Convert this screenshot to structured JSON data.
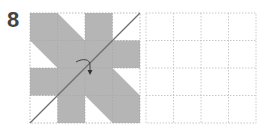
{
  "step": {
    "number": "8"
  },
  "colors": {
    "number_text": "#444444",
    "shape_fill": "#b5b5b5",
    "grid_line": "#bbbbbb",
    "fold_line": "#6e6e6e",
    "arrow": "#333333",
    "background": "#ffffff"
  },
  "diagram": {
    "grid_rows": 4,
    "grid_cols": 4,
    "left_grid": {
      "description": "folding diagram with shaded pinwheel shape, diagonal fold line and curved fold arrow",
      "origin_px": [
        30,
        13
      ],
      "size_px": 110,
      "shape_polygon_grid_units": [
        [
          0,
          0
        ],
        [
          1,
          0
        ],
        [
          2,
          1
        ],
        [
          2,
          0
        ],
        [
          3,
          0
        ],
        [
          3,
          1
        ],
        [
          4,
          1
        ],
        [
          4,
          2
        ],
        [
          3,
          2
        ],
        [
          4,
          3
        ],
        [
          4,
          4
        ],
        [
          3,
          4
        ],
        [
          2,
          3
        ],
        [
          2,
          4
        ],
        [
          1,
          4
        ],
        [
          1,
          3
        ],
        [
          0,
          3
        ],
        [
          0,
          2
        ],
        [
          1,
          2
        ],
        [
          0,
          1
        ]
      ],
      "fold_line": {
        "from_grid": [
          0,
          4
        ],
        "to_grid": [
          4,
          0
        ]
      },
      "fold_arrow": {
        "type": "curved",
        "direction": "over-and-down"
      }
    },
    "right_grid": {
      "description": "empty answer grid",
      "origin_px": [
        146,
        13
      ],
      "size_px": 110
    }
  }
}
